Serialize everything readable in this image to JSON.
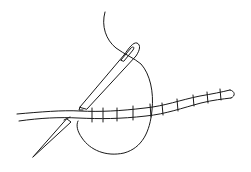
{
  "illustration": {
    "subject": "needle and thread whipping stitches around a cord",
    "colors": {
      "background": "#ffffff",
      "ink": "#1a1a1a"
    },
    "elements": {
      "thread": "thread-loop",
      "upper_needle": "sewing-needle",
      "lower_needle": "needle-point",
      "cord": "cord-with-stitches"
    },
    "stitch_count": 10
  }
}
